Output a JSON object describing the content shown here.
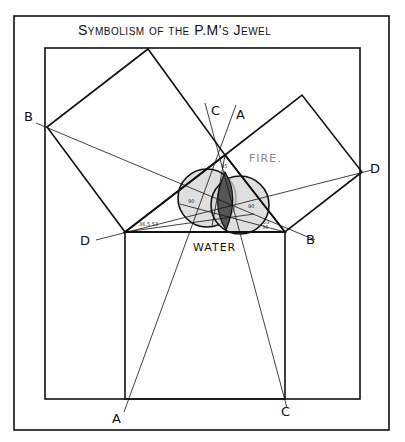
{
  "title": "Symbolism of the P.M's Jewel",
  "labels": {
    "b_left": "B",
    "d_right": "D",
    "d_left": "D",
    "b_right": "B",
    "c_top": "C",
    "a_top": "A",
    "a_bottom": "A",
    "c_bottom": "C",
    "fire": "FIRE.",
    "water": "WATER"
  },
  "angle_marks": {
    "apex": "45°",
    "left_base": "36.5°",
    "right_base": "53.5°",
    "left_circle": "90°",
    "right_circle": "90°"
  },
  "colors": {
    "ink": "#111111",
    "fire_label": "#8a8a8a",
    "circle_fill": "#c8c8c8",
    "lens_fill": "#555555",
    "background": "#ffffff"
  },
  "geometry": {
    "outer_frame": [
      14,
      16,
      389,
      430
    ],
    "inner_frame": [
      45,
      48,
      360,
      399
    ],
    "triangle": [
      [
        225,
        155
      ],
      [
        125,
        232
      ],
      [
        285,
        232
      ]
    ],
    "circles": [
      {
        "cx": 207,
        "cy": 198,
        "r": 29
      },
      {
        "cx": 240,
        "cy": 205,
        "r": 29
      }
    ]
  }
}
